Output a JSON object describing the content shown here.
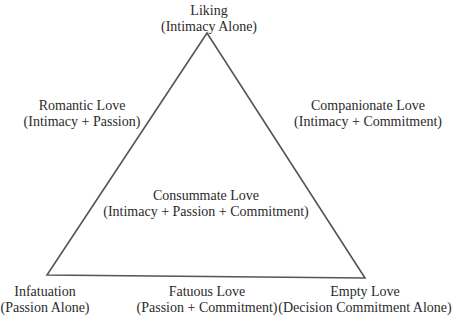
{
  "diagram": {
    "line_color": "#555555",
    "background": "#ffffff",
    "triangle": {
      "apex": [
        207,
        33
      ],
      "bottom_left": [
        47,
        275
      ],
      "bottom_right": [
        365,
        278
      ]
    },
    "labels": {
      "top": {
        "name": "Liking",
        "components": "(Intimacy Alone)"
      },
      "left_side": {
        "name": "Romantic Love",
        "components": "(Intimacy + Passion)"
      },
      "right_side": {
        "name": "Companionate Love",
        "components": "(Intimacy + Commitment)"
      },
      "center": {
        "name": "Consummate Love",
        "components": "(Intimacy + Passion + Commitment)"
      },
      "bottom_left": {
        "name": "Infatuation",
        "components": "(Passion Alone)"
      },
      "bottom_center": {
        "name": "Fatuous Love",
        "components": "(Passion + Commitment)"
      },
      "bottom_right": {
        "name": "Empty Love",
        "components": "(Decision Commitment Alone)"
      }
    }
  }
}
